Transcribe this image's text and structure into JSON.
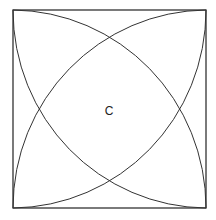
{
  "diagram": {
    "type": "geometry",
    "square": {
      "x": 13,
      "y": 10,
      "side": 193
    },
    "center_label": "C",
    "stroke_color": "#333333",
    "background": "#ffffff"
  }
}
